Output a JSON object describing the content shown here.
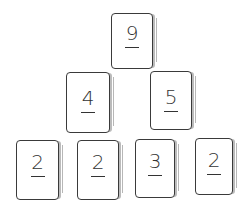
{
  "diagram": {
    "type": "number-pyramid",
    "style": "hand-drawn sketch",
    "rows": [
      {
        "cards": [
          {
            "value": "9"
          }
        ]
      },
      {
        "cards": [
          {
            "value": "4"
          },
          {
            "value": "5"
          }
        ]
      },
      {
        "cards": [
          {
            "value": "2"
          },
          {
            "value": "2"
          },
          {
            "value": "3"
          },
          {
            "value": "2"
          }
        ]
      }
    ]
  }
}
